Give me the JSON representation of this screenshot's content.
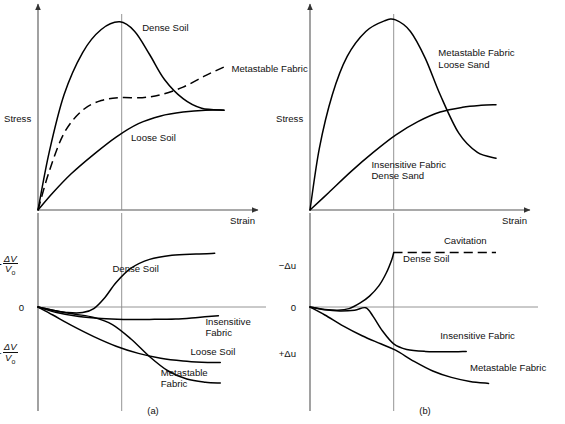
{
  "figure": {
    "captions": {
      "left": "(a)",
      "right": "(b)"
    }
  },
  "chart_data": [
    {
      "id": "panel-a-stress",
      "type": "line",
      "title": "",
      "xlabel": "Strain",
      "ylabel": "Stress",
      "xlim": [
        0,
        1
      ],
      "ylim": [
        0,
        1
      ],
      "grid": false,
      "reference_line_x": 0.45,
      "legend": "inline-annotations",
      "series": [
        {
          "name": "Dense Soil",
          "style": "solid",
          "label_x": 0.56,
          "label_y": 0.93,
          "points": [
            [
              0,
              0
            ],
            [
              0.06,
              0.3
            ],
            [
              0.14,
              0.6
            ],
            [
              0.24,
              0.82
            ],
            [
              0.34,
              0.94
            ],
            [
              0.44,
              0.98
            ],
            [
              0.52,
              0.93
            ],
            [
              0.6,
              0.81
            ],
            [
              0.68,
              0.68
            ],
            [
              0.78,
              0.58
            ],
            [
              0.88,
              0.53
            ],
            [
              1.0,
              0.52
            ]
          ]
        },
        {
          "name": "Metastable Fabric",
          "style": "dashed",
          "label_x": 1.04,
          "label_y": 0.72,
          "points": [
            [
              0,
              0
            ],
            [
              0.06,
              0.2
            ],
            [
              0.14,
              0.4
            ],
            [
              0.24,
              0.52
            ],
            [
              0.34,
              0.57
            ],
            [
              0.44,
              0.585
            ],
            [
              0.56,
              0.585
            ],
            [
              0.66,
              0.6
            ],
            [
              0.78,
              0.64
            ],
            [
              0.9,
              0.7
            ],
            [
              1.0,
              0.745
            ]
          ]
        },
        {
          "name": "Loose Soil",
          "style": "solid",
          "label_x": 0.5,
          "label_y": 0.36,
          "points": [
            [
              0,
              0
            ],
            [
              0.08,
              0.09
            ],
            [
              0.18,
              0.19
            ],
            [
              0.3,
              0.29
            ],
            [
              0.42,
              0.38
            ],
            [
              0.54,
              0.45
            ],
            [
              0.66,
              0.49
            ],
            [
              0.78,
              0.51
            ],
            [
              0.9,
              0.52
            ],
            [
              1.0,
              0.52
            ]
          ]
        }
      ]
    },
    {
      "id": "panel-a-volume",
      "type": "line",
      "xlabel": "",
      "ylabel_positive": "+ΔV/V₀",
      "ylabel_zero": "0",
      "ylabel_negative": "−ΔV/V₀",
      "xlim": [
        0,
        1
      ],
      "ylim": [
        -1,
        1
      ],
      "grid": false,
      "reference_line_x": 0.45,
      "series": [
        {
          "name": "Dense Soil",
          "style": "solid",
          "label_x": 0.4,
          "label_y": 0.52,
          "points": [
            [
              0,
              0
            ],
            [
              0.08,
              -0.04
            ],
            [
              0.16,
              -0.07
            ],
            [
              0.24,
              -0.07
            ],
            [
              0.3,
              -0.02
            ],
            [
              0.36,
              0.14
            ],
            [
              0.42,
              0.36
            ],
            [
              0.5,
              0.57
            ],
            [
              0.6,
              0.7
            ],
            [
              0.72,
              0.76
            ],
            [
              0.85,
              0.78
            ],
            [
              0.95,
              0.79
            ]
          ]
        },
        {
          "name": "Insensitive Fabric",
          "style": "solid",
          "label_x": 0.9,
          "label_y": -0.22,
          "label_lines": [
            "Insensitive",
            "Fabric"
          ],
          "points": [
            [
              0,
              0
            ],
            [
              0.1,
              -0.07
            ],
            [
              0.22,
              -0.12
            ],
            [
              0.34,
              -0.145
            ],
            [
              0.46,
              -0.155
            ],
            [
              0.6,
              -0.155
            ],
            [
              0.74,
              -0.15
            ],
            [
              0.86,
              -0.13
            ],
            [
              0.97,
              -0.11
            ]
          ]
        },
        {
          "name": "Loose Soil",
          "style": "solid",
          "label_x": 0.82,
          "label_y": -0.6,
          "points": [
            [
              0,
              0
            ],
            [
              0.08,
              -0.1
            ],
            [
              0.18,
              -0.23
            ],
            [
              0.3,
              -0.37
            ],
            [
              0.42,
              -0.49
            ],
            [
              0.54,
              -0.58
            ],
            [
              0.66,
              -0.64
            ],
            [
              0.78,
              -0.675
            ],
            [
              0.88,
              -0.69
            ],
            [
              0.98,
              -0.695
            ]
          ]
        },
        {
          "name": "Metastable Fabric",
          "style": "solid",
          "label_x": 0.66,
          "label_y": -0.86,
          "label_lines": [
            "Metastable",
            "Fabric"
          ],
          "points": [
            [
              0,
              0
            ],
            [
              0.1,
              -0.05
            ],
            [
              0.2,
              -0.09
            ],
            [
              0.3,
              -0.13
            ],
            [
              0.4,
              -0.22
            ],
            [
              0.5,
              -0.4
            ],
            [
              0.6,
              -0.62
            ],
            [
              0.7,
              -0.8
            ],
            [
              0.8,
              -0.9
            ],
            [
              0.9,
              -0.94
            ],
            [
              0.98,
              -0.95
            ]
          ]
        }
      ]
    },
    {
      "id": "panel-b-stress",
      "type": "line",
      "xlabel": "Strain",
      "ylabel": "Stress",
      "xlim": [
        0,
        1
      ],
      "ylim": [
        0,
        1
      ],
      "grid": false,
      "reference_line_x": 0.45,
      "series": [
        {
          "name": "Metastable Fabric Loose Sand",
          "style": "solid",
          "label_x": 0.69,
          "label_y": 0.8,
          "label_lines": [
            "Metastable Fabric",
            "Loose Sand"
          ],
          "points": [
            [
              0,
              0
            ],
            [
              0.05,
              0.32
            ],
            [
              0.12,
              0.6
            ],
            [
              0.2,
              0.8
            ],
            [
              0.3,
              0.93
            ],
            [
              0.4,
              0.985
            ],
            [
              0.46,
              0.99
            ],
            [
              0.54,
              0.93
            ],
            [
              0.62,
              0.79
            ],
            [
              0.7,
              0.6
            ],
            [
              0.8,
              0.4
            ],
            [
              0.9,
              0.3
            ],
            [
              1.0,
              0.27
            ]
          ]
        },
        {
          "name": "Insensitive Fabric Dense Sand",
          "style": "solid",
          "label_x": 0.33,
          "label_y": 0.22,
          "label_lines": [
            "Insensitive Fabric",
            "Dense Sand"
          ],
          "points": [
            [
              0,
              0
            ],
            [
              0.1,
              0.09
            ],
            [
              0.22,
              0.2
            ],
            [
              0.34,
              0.3
            ],
            [
              0.46,
              0.39
            ],
            [
              0.58,
              0.46
            ],
            [
              0.7,
              0.51
            ],
            [
              0.82,
              0.535
            ],
            [
              0.92,
              0.545
            ],
            [
              1.0,
              0.548
            ]
          ]
        }
      ]
    },
    {
      "id": "panel-b-porepressure",
      "type": "line",
      "xlabel": "",
      "ylabel_negative_top": "−Δu",
      "ylabel_zero": "0",
      "ylabel_positive_bottom": "+Δu",
      "xlim": [
        0,
        1
      ],
      "ylim": [
        -1,
        1
      ],
      "grid": false,
      "reference_line_x": 0.45,
      "series": [
        {
          "name": "Cavitation",
          "style": "dashed",
          "label_x": 0.72,
          "label_y": 0.92,
          "points": [
            [
              0.45,
              0.8
            ],
            [
              0.6,
              0.8
            ],
            [
              0.75,
              0.8
            ],
            [
              0.9,
              0.8
            ],
            [
              1.0,
              0.8
            ]
          ]
        },
        {
          "name": "Dense Soil",
          "style": "solid",
          "label_x": 0.5,
          "label_y": 0.66,
          "points": [
            [
              0,
              0
            ],
            [
              0.08,
              -0.03
            ],
            [
              0.15,
              -0.04
            ],
            [
              0.21,
              -0.02
            ],
            [
              0.27,
              0.06
            ],
            [
              0.32,
              0.16
            ],
            [
              0.37,
              0.31
            ],
            [
              0.41,
              0.5
            ],
            [
              0.44,
              0.7
            ],
            [
              0.45,
              0.8
            ]
          ]
        },
        {
          "name": "Insensitive Fabric",
          "style": "solid",
          "label_x": 0.7,
          "label_y": -0.4,
          "points": [
            [
              0,
              0
            ],
            [
              0.08,
              -0.035
            ],
            [
              0.16,
              -0.05
            ],
            [
              0.24,
              -0.04
            ],
            [
              0.3,
              -0.01
            ],
            [
              0.34,
              -0.12
            ],
            [
              0.39,
              -0.3
            ],
            [
              0.45,
              -0.46
            ],
            [
              0.52,
              -0.53
            ],
            [
              0.62,
              -0.555
            ],
            [
              0.74,
              -0.56
            ],
            [
              0.84,
              -0.555
            ]
          ]
        },
        {
          "name": "Metastable Fabric",
          "style": "solid",
          "label_x": 0.86,
          "label_y": -0.8,
          "points": [
            [
              0,
              0
            ],
            [
              0.08,
              -0.1
            ],
            [
              0.18,
              -0.24
            ],
            [
              0.28,
              -0.36
            ],
            [
              0.38,
              -0.46
            ],
            [
              0.46,
              -0.54
            ],
            [
              0.56,
              -0.68
            ],
            [
              0.66,
              -0.8
            ],
            [
              0.76,
              -0.88
            ],
            [
              0.86,
              -0.93
            ],
            [
              0.96,
              -0.955
            ]
          ]
        }
      ]
    }
  ]
}
